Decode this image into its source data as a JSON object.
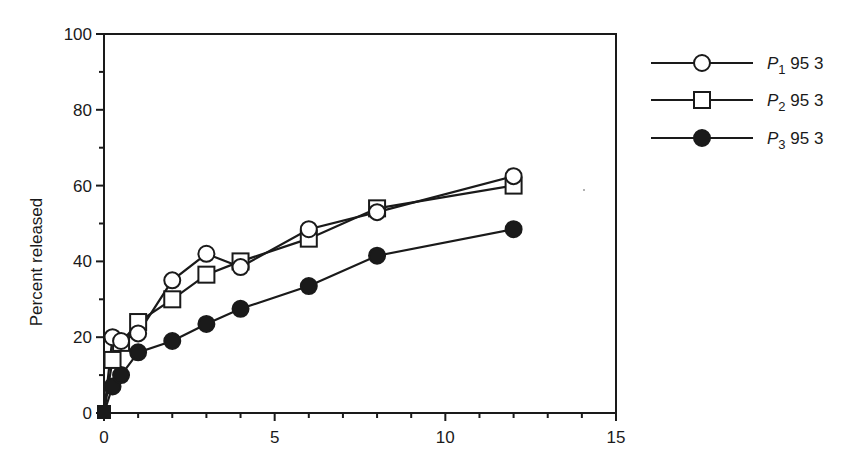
{
  "chart_data": {
    "type": "line",
    "title": "",
    "xlabel": "",
    "ylabel": "Percent released",
    "xlim": [
      0,
      15
    ],
    "ylim": [
      0,
      100
    ],
    "x_ticks": [
      0,
      5,
      10,
      15
    ],
    "x_minor_step": 1,
    "y_ticks": [
      0,
      20,
      40,
      60,
      80,
      100
    ],
    "y_minor_step": 10,
    "grid": false,
    "legend_position": "right-outside-top",
    "series": [
      {
        "name": "P1 95 3",
        "label_base": "P",
        "label_sub": "1",
        "label_rest": " 95 3",
        "marker": "open-circle",
        "points": [
          [
            0,
            0
          ],
          [
            0.25,
            20
          ],
          [
            0.5,
            19
          ],
          [
            1,
            21
          ],
          [
            2,
            35
          ],
          [
            3,
            42
          ],
          [
            4,
            38.5
          ],
          [
            6,
            48.5
          ],
          [
            8,
            53
          ],
          [
            12,
            62.5
          ]
        ]
      },
      {
        "name": "P2 95 3",
        "label_base": "P",
        "label_sub": "2",
        "label_rest": " 95 3",
        "marker": "open-square",
        "points": [
          [
            0,
            0
          ],
          [
            0.25,
            14
          ],
          [
            0.5,
            18.5
          ],
          [
            1,
            24
          ],
          [
            2,
            30
          ],
          [
            3,
            36.5
          ],
          [
            4,
            40
          ],
          [
            6,
            46
          ],
          [
            8,
            54
          ],
          [
            12,
            60
          ]
        ]
      },
      {
        "name": "P3 95 3",
        "label_base": "P",
        "label_sub": "3",
        "label_rest": " 95 3",
        "marker": "filled-circle",
        "points": [
          [
            0,
            0
          ],
          [
            0.25,
            7
          ],
          [
            0.5,
            10
          ],
          [
            1,
            16
          ],
          [
            2,
            19
          ],
          [
            3,
            23.5
          ],
          [
            4,
            27.5
          ],
          [
            6,
            33.5
          ],
          [
            8,
            41.5
          ],
          [
            12,
            48.5
          ]
        ]
      }
    ]
  },
  "colors": {
    "ink": "#1a1a1a",
    "background": "#ffffff"
  }
}
